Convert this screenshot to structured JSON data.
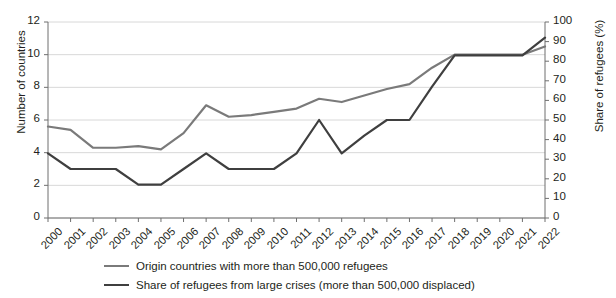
{
  "title": "",
  "axes": {
    "left_label": "Number of countries",
    "right_label": "Share of refugees (%)",
    "left_ticks": [
      "0",
      "2",
      "4",
      "6",
      "8",
      "10",
      "12"
    ],
    "right_ticks": [
      "0",
      "10",
      "20",
      "30",
      "40",
      "50",
      "60",
      "70",
      "80",
      "90",
      "100"
    ]
  },
  "legend": {
    "items": [
      {
        "label": "Origin countries with more than 500,000 refugees",
        "color": "#7a7a7a"
      },
      {
        "label": "Share of refugees from large crises (more than 500,000 displaced)",
        "color": "#3f3f3f"
      }
    ]
  },
  "colors": {
    "series_origin": "#7a7a7a",
    "series_share": "#3f3f3f",
    "gridline": "#d8d8d8",
    "axis": "#6f6f6f",
    "text": "#231f20"
  },
  "chart_data": {
    "type": "line",
    "title": "",
    "xlabel": "",
    "ylabel": "Number of countries",
    "y2label": "Share of refugees (%)",
    "ylim": [
      0,
      12
    ],
    "y2lim": [
      0,
      100
    ],
    "grid": true,
    "legend_position": "bottom",
    "categories": [
      "2000",
      "2001",
      "2002",
      "2003",
      "2004",
      "2005",
      "2006",
      "2007",
      "2008",
      "2009",
      "2010",
      "2011",
      "2012",
      "2013",
      "2014",
      "2015",
      "2016",
      "2017",
      "2018",
      "2019",
      "2020",
      "2021",
      "2022"
    ],
    "series": [
      {
        "name": "Origin countries with more than 500,000 refugees",
        "axis": "left",
        "unit": "countries",
        "color": "#7a7a7a",
        "values": [
          5.6,
          5.4,
          4.3,
          4.3,
          4.4,
          4.2,
          5.2,
          6.9,
          6.2,
          6.3,
          6.5,
          6.7,
          7.3,
          7.1,
          7.5,
          7.9,
          8.2,
          9.2,
          10.0,
          10.0,
          10.0,
          10.0,
          10.5
        ]
      },
      {
        "name": "Share of refugees from large crises (more than 500,000 displaced)",
        "axis": "right",
        "unit": "%",
        "color": "#3f3f3f",
        "values": [
          33,
          25,
          25,
          25,
          17,
          17,
          25,
          33,
          25,
          25,
          25,
          33,
          50,
          33,
          42,
          50,
          50,
          67,
          83,
          83,
          83,
          83,
          92
        ]
      }
    ]
  }
}
